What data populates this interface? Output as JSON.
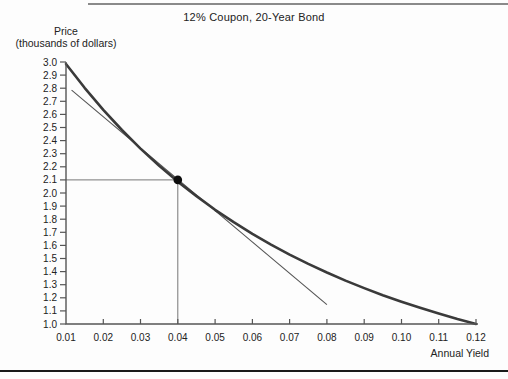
{
  "figure": {
    "title": "12% Coupon, 20-Year Bond",
    "y_axis_title_line1": "Price",
    "y_axis_title_line2": "(thousands of dollars)",
    "x_axis_title": "Annual Yield"
  },
  "colors": {
    "curve": "#3a3a3a",
    "tangent": "#555555",
    "axis": "#555555",
    "reference_line": "#777777",
    "marker": "#0d0d0d",
    "text": "#222222",
    "top_rule": "#8a8a8a",
    "bottom_rule": "#1a1a1a"
  },
  "chart_data": {
    "type": "line",
    "title": "12% Coupon, 20-Year Bond",
    "xlabel": "Annual Yield",
    "ylabel": "Price (thousands of dollars)",
    "xlim": [
      0.01,
      0.12
    ],
    "ylim": [
      1.0,
      3.0
    ],
    "grid": false,
    "legend": false,
    "x_ticks": [
      "0.01",
      "0.02",
      "0.03",
      "0.04",
      "0.05",
      "0.06",
      "0.07",
      "0.08",
      "0.09",
      "0.10",
      "0.11",
      "0.12"
    ],
    "y_ticks": [
      "3.0",
      "2.9",
      "2.8",
      "2.7",
      "2.6",
      "2.5",
      "2.4",
      "2.3",
      "2.2",
      "2.1",
      "2.0",
      "1.9",
      "1.8",
      "1.7",
      "1.6",
      "1.5",
      "1.4",
      "1.3",
      "1.2",
      "1.1",
      "1.0"
    ],
    "series": [
      {
        "name": "price-yield curve",
        "x": [
          0.01,
          0.015,
          0.02,
          0.025,
          0.03,
          0.035,
          0.04,
          0.045,
          0.05,
          0.055,
          0.06,
          0.065,
          0.07,
          0.075,
          0.08,
          0.085,
          0.09,
          0.095,
          0.1,
          0.105,
          0.11,
          0.115,
          0.12
        ],
        "y": [
          2.985,
          2.803,
          2.635,
          2.481,
          2.339,
          2.208,
          2.087,
          1.976,
          1.872,
          1.777,
          1.688,
          1.606,
          1.53,
          1.459,
          1.393,
          1.331,
          1.274,
          1.22,
          1.17,
          1.124,
          1.08,
          1.038,
          1.0
        ]
      },
      {
        "name": "tangent line at 4% yield",
        "x": [
          0.0115,
          0.08
        ],
        "y": [
          2.785,
          1.148
        ]
      }
    ],
    "marker_point": {
      "x": 0.04,
      "y": 2.1
    },
    "reference_lines": {
      "horizontal_at_price": 2.1,
      "vertical_at_yield": 0.04
    }
  }
}
